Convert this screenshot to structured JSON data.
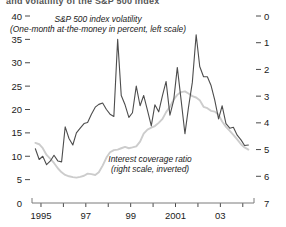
{
  "chart_data": {
    "type": "line",
    "title": "",
    "xlabel": "",
    "ylabel": "",
    "grid": false,
    "legend_position": "inside-annotations",
    "x_axis": {
      "tick_values": [
        1995,
        1996,
        1997,
        1998,
        1999,
        2000,
        2001,
        2002,
        2003,
        2004
      ],
      "tick_labels": [
        "1995",
        "",
        "97",
        "",
        "99",
        "",
        "2001",
        "",
        "03",
        ""
      ],
      "range": [
        1994.6,
        2004.5
      ]
    },
    "y_axis_left": {
      "label": "S&P 500 index volatility",
      "tick_values": [
        0,
        5,
        10,
        15,
        20,
        25,
        30,
        35,
        40
      ],
      "tick_labels": [
        "0",
        "5",
        "10",
        "15",
        "20",
        "25",
        "30",
        "35",
        "40"
      ],
      "range": [
        0,
        40
      ],
      "side": "left",
      "inverted": false
    },
    "y_axis_right": {
      "label": "Interest coverage ratio",
      "tick_values": [
        0,
        1,
        2,
        3,
        4,
        5,
        6,
        7
      ],
      "tick_labels": [
        "0",
        "1",
        "2",
        "3",
        "4",
        "5",
        "6",
        "7"
      ],
      "range": [
        0,
        7
      ],
      "side": "right",
      "inverted": true
    },
    "annotations": [
      {
        "name": "volatility-annotation",
        "line1": "S&P 500 index volatility",
        "line2": "(One-month at-the-money in percent, left scale)"
      },
      {
        "name": "coverage-annotation",
        "line1": "Interest coverage ratio",
        "line2": "(right scale, inverted)"
      }
    ],
    "series": [
      {
        "name": "S&P 500 index volatility",
        "axis": "left",
        "color": "#4d4d4d",
        "x": [
          1994.75,
          1994.92,
          1995.08,
          1995.25,
          1995.42,
          1995.58,
          1995.75,
          1995.92,
          1996.08,
          1996.25,
          1996.42,
          1996.58,
          1996.75,
          1996.92,
          1997.08,
          1997.25,
          1997.42,
          1997.58,
          1997.75,
          1997.92,
          1998.08,
          1998.25,
          1998.42,
          1998.58,
          1998.75,
          1998.92,
          1999.08,
          1999.25,
          1999.42,
          1999.58,
          1999.75,
          1999.92,
          2000.08,
          2000.25,
          2000.42,
          2000.58,
          2000.75,
          2000.92,
          2001.08,
          2001.25,
          2001.42,
          2001.58,
          2001.75,
          2001.92,
          2002.08,
          2002.25,
          2002.42,
          2002.58,
          2002.75,
          2002.92,
          2003.08,
          2003.25,
          2003.42,
          2003.58,
          2003.75,
          2003.92,
          2004.08,
          2004.25
        ],
        "values": [
          11.6,
          9.3,
          10.0,
          8.2,
          9.0,
          10.2,
          9.0,
          8.8,
          16.3,
          13.8,
          12.4,
          15.0,
          16.0,
          17.0,
          17.2,
          19.0,
          20.5,
          21.1,
          21.4,
          20.0,
          19.0,
          18.5,
          35.0,
          23.0,
          21.0,
          18.3,
          19.3,
          25.0,
          20.8,
          23.0,
          19.8,
          16.5,
          21.0,
          19.5,
          23.0,
          26.0,
          18.8,
          22.0,
          29.0,
          22.0,
          14.8,
          20.5,
          25.8,
          36.0,
          29.2,
          27.0,
          27.0,
          25.2,
          22.0,
          18.0,
          20.8,
          17.0,
          16.0,
          16.2,
          14.5,
          13.5,
          12.3,
          12.4
        ]
      },
      {
        "name": "Interest coverage ratio",
        "axis": "right",
        "color": "#cccccc",
        "x": [
          1994.75,
          1994.92,
          1995.08,
          1995.25,
          1995.42,
          1995.58,
          1995.75,
          1995.92,
          1996.08,
          1996.25,
          1996.42,
          1996.58,
          1996.75,
          1996.92,
          1997.08,
          1997.25,
          1997.42,
          1997.58,
          1997.75,
          1997.92,
          1998.08,
          1998.25,
          1998.42,
          1998.58,
          1998.75,
          1998.92,
          1999.08,
          1999.25,
          1999.42,
          1999.58,
          1999.75,
          1999.92,
          2000.08,
          2000.25,
          2000.42,
          2000.58,
          2000.75,
          2000.92,
          2001.08,
          2001.25,
          2001.42,
          2001.58,
          2001.75,
          2001.92,
          2002.08,
          2002.25,
          2002.42,
          2002.58,
          2002.75,
          2002.92,
          2003.08,
          2003.25,
          2003.42,
          2003.58,
          2003.75,
          2003.92,
          2004.08,
          2004.25
        ],
        "values": [
          4.75,
          4.8,
          4.95,
          5.2,
          5.35,
          5.5,
          5.7,
          5.85,
          5.95,
          6.0,
          6.03,
          6.05,
          6.02,
          5.98,
          5.9,
          5.92,
          5.95,
          5.85,
          5.6,
          5.3,
          5.1,
          5.02,
          5.0,
          4.95,
          4.9,
          4.95,
          4.92,
          4.88,
          4.7,
          4.4,
          4.25,
          4.18,
          4.12,
          4.0,
          3.85,
          3.6,
          3.4,
          3.12,
          2.95,
          2.85,
          2.82,
          2.9,
          3.0,
          3.05,
          3.15,
          3.4,
          3.45,
          3.55,
          3.58,
          3.7,
          3.95,
          4.15,
          4.3,
          4.45,
          4.62,
          4.8,
          4.92,
          5.0
        ]
      }
    ]
  },
  "top_cropped_title": "and volatility of the S&P 500 index"
}
